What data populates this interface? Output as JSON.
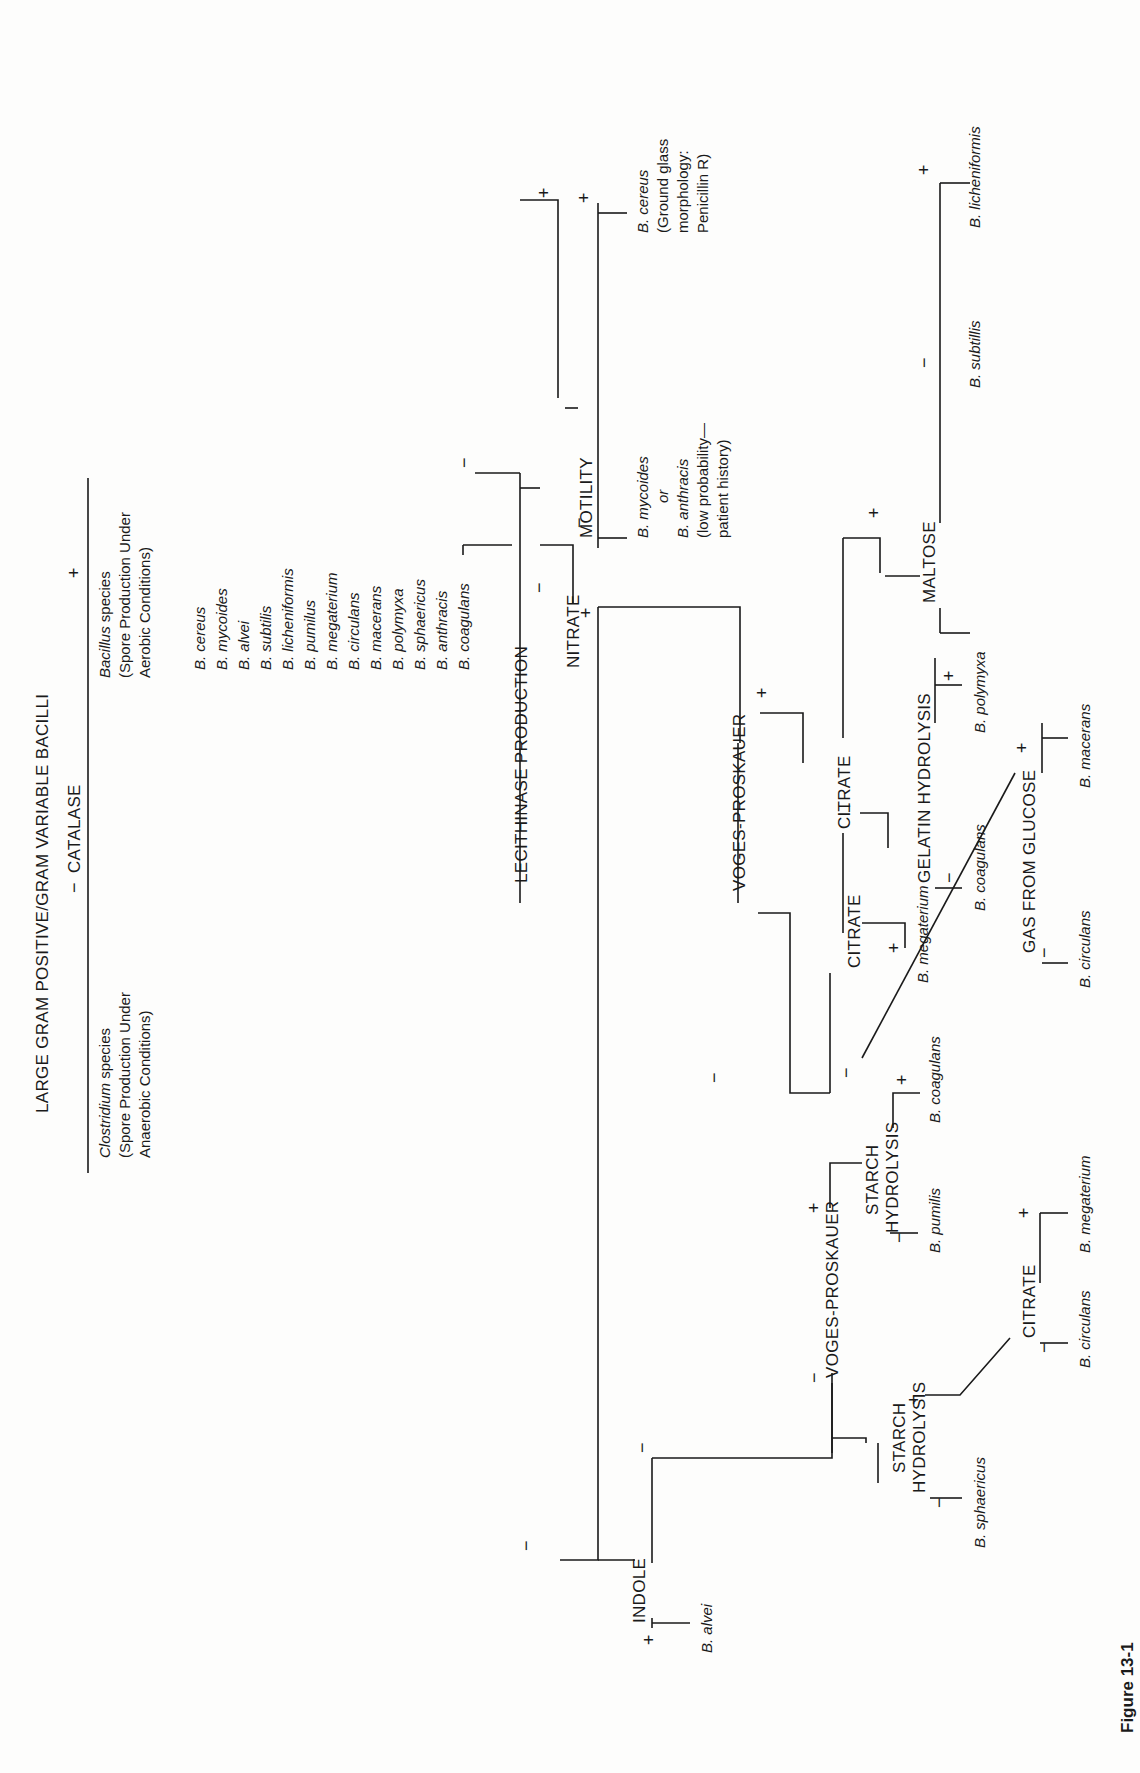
{
  "figure": {
    "label": "Figure 13-1",
    "title": "LARGE GRAM POSITIVE/GRAM VARIABLE BACILLI"
  },
  "catalase": {
    "test": "CATALASE",
    "negative_sign": "−",
    "positive_sign": "+",
    "negative": {
      "genus": "Clostridium",
      "genus_suffix": " species",
      "line2": "(Spore Production Under",
      "line3": "Anaerobic Conditions)"
    },
    "positive": {
      "genus": "Bacillus",
      "genus_suffix": " species",
      "line2": "(Spore Production Under",
      "line3": "Aerobic Conditions)"
    }
  },
  "species_list": [
    "B. cereus",
    "B. mycoides",
    "B. alvei",
    "B. subtilis",
    "B. licheniformis",
    "B. pumilus",
    "B. megaterium",
    "B. circulans",
    "B. macerans",
    "B. polymyxa",
    "B. sphaericus",
    "B. anthracis",
    "B. coagulans"
  ],
  "lecithinase": {
    "test": "LECITHINASE PRODUCTION",
    "negative_sign": "−",
    "positive_sign": "+"
  },
  "motility": {
    "test": "MOTILITY",
    "negative_sign": "−",
    "positive_sign": "+",
    "negative_result": {
      "line1": "B. mycoides",
      "line2": "or",
      "line3": "B. anthracis",
      "line4": "(low probability—",
      "line5": "patient history)"
    },
    "positive_result": {
      "line1": "B. cereus",
      "line2": "(Ground glass",
      "line3": "morphology:",
      "line4": "Penicillin R)"
    }
  },
  "nitrate": {
    "test": "NITRATE",
    "negative_sign": "−",
    "positive_sign": "+"
  },
  "nitrate_pos_vp": {
    "test": "VOGES-PROSKAUER",
    "negative_sign": "−",
    "positive_sign": "+"
  },
  "vp_pos_citrate": {
    "test": "CITRATE",
    "negative_sign": "−",
    "positive_sign": "+"
  },
  "maltose": {
    "test": "MALTOSE",
    "negative_sign": "−",
    "positive_sign": "+",
    "negative_result": "B. subtillis",
    "positive_result": "B. licheniformis"
  },
  "gelatin": {
    "test": "GELATIN HYDROLYSIS",
    "negative_sign": "−",
    "positive_sign": "+",
    "negative_result": "B. coagulans",
    "positive_result": "B. polymyxa"
  },
  "vp_neg_citrate": {
    "test": "CITRATE",
    "negative_sign": "−",
    "positive_sign": "+",
    "positive_result": "B. megaterium"
  },
  "gas_glucose": {
    "test": "GAS FROM GLUCOSE",
    "negative_sign": "−",
    "positive_sign": "+",
    "negative_result": "B. circulans",
    "positive_result": "B. macerans"
  },
  "indole": {
    "test": "INDOLE",
    "negative_sign": "−",
    "positive_sign": "+",
    "positive_result": "B. alvei"
  },
  "indole_neg_vp": {
    "test": "VOGES-PROSKAUER",
    "negative_sign": "−",
    "positive_sign": "+"
  },
  "starch_vp_pos": {
    "line1": "STARCH",
    "line2": "HYDROLYSIS",
    "negative_sign": "−",
    "positive_sign": "+",
    "negative_result": "B. pumilis",
    "positive_result": "B. coagulans"
  },
  "starch_vp_neg": {
    "line1": "STARCH",
    "line2": "HYDROLYSIS",
    "negative_sign": "−",
    "positive_sign": "+",
    "negative_result": "B. sphaericus"
  },
  "starch_citrate": {
    "test": "CITRATE",
    "negative_sign": "−",
    "positive_sign": "+",
    "negative_result": "B. circulans",
    "positive_result": "B. megaterium"
  },
  "colors": {
    "ink": "#1a1a1a",
    "paper": "#fdfdfc"
  }
}
